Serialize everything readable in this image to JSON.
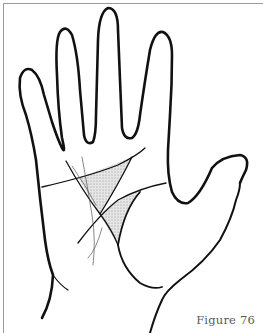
{
  "figure": {
    "caption": "Figure 76",
    "colors": {
      "ink": "#111111",
      "fine_line": "#555555",
      "shading": "#d8d8d8",
      "border": "#9a9a9a",
      "caption": "#5a5a5a"
    }
  }
}
